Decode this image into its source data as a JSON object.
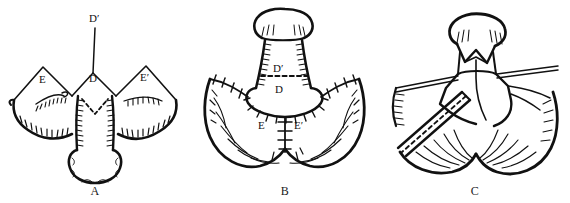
{
  "figure": {
    "style": "black ink line drawing on white",
    "ink_color": "#111111",
    "background_color": "#ffffff",
    "panel_count": 3
  },
  "panels": [
    {
      "caption": "A",
      "name": "panel-a",
      "description": "Pre-operative markings: midline vertical incision line with apex D', central flap D, and two lateral triangular flaps E and E' outlined above hatched scrotal folds; dashed chevron marking at the base of the shaft.",
      "labels": [
        {
          "text": "D′",
          "x": 96,
          "y": 18
        },
        {
          "text": "D",
          "x": 93,
          "y": 78
        },
        {
          "text": "E",
          "x": 43,
          "y": 79
        },
        {
          "text": "E′",
          "x": 146,
          "y": 77
        }
      ]
    },
    {
      "caption": "B",
      "name": "panel-b",
      "description": "Flaps transposed and sutured: interrupted cross-stitch suture lines run laterally and around the shaft base; dashed transverse line separates D' above from D below; vertical midline suture line flanked by E and E'.",
      "labels": [
        {
          "text": "D′",
          "x": 88,
          "y": 68
        },
        {
          "text": "D",
          "x": 89,
          "y": 89
        },
        {
          "text": "E",
          "x": 72,
          "y": 125
        },
        {
          "text": "E′",
          "x": 110,
          "y": 125
        }
      ]
    },
    {
      "caption": "C",
      "name": "panel-c",
      "description": "Completed repair with zigzag chevron closure beneath the glans, paired suture tails drawn laterally, and an obliquely placed segmented drain/catheter tube crossing the lower left field.",
      "labels": []
    }
  ]
}
